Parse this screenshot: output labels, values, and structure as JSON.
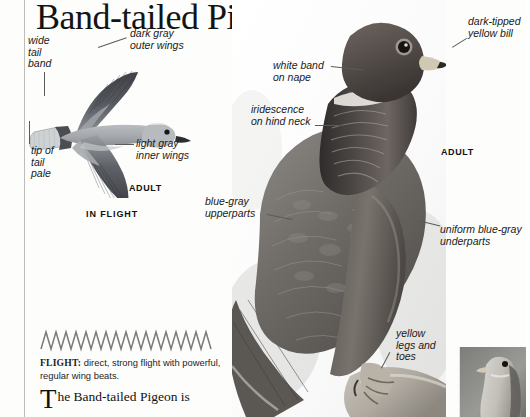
{
  "page": {
    "title": "Band-tailed Pigeon",
    "background_color": "#fdfdfc",
    "rule_color": "#bdbdbd"
  },
  "flight_illustration": {
    "plate_label": "IN FLIGHT",
    "age_label": "ADULT",
    "callouts": [
      {
        "id": "wide-tail-band",
        "text": "wide\ntail\nband"
      },
      {
        "id": "dark-gray-outer-wings",
        "text": "dark gray\nouter wings"
      },
      {
        "id": "tip-of-tail-pale",
        "text": "tip of\ntail\npale"
      },
      {
        "id": "light-gray-inner-wings",
        "text": "light gray\ninner wings"
      }
    ]
  },
  "main_photo": {
    "age_label": "ADULT",
    "callouts": [
      {
        "id": "dark-tipped-yellow-bill",
        "text": "dark-tipped\nyellow bill"
      },
      {
        "id": "white-band-on-nape",
        "text": "white band\non nape"
      },
      {
        "id": "iridescence-on-hind-neck",
        "text": "iridescence\non hind neck"
      },
      {
        "id": "blue-gray-upperparts",
        "text": "blue-gray\nupperparts"
      },
      {
        "id": "uniform-blue-gray-underparts",
        "text": "uniform blue-gray\nunderparts"
      },
      {
        "id": "yellow-legs-and-toes",
        "text": "yellow\nlegs and\ntoes"
      }
    ]
  },
  "flight_pattern": {
    "heading": "FLIGHT:",
    "description": " direct, strong flight with powerful, regular wing beats."
  },
  "body_text": {
    "dropcap": "T",
    "rest": "he Band-tailed Pigeon is"
  },
  "colors": {
    "text": "#141414",
    "leader": "#5b5b5b",
    "rule": "#bdbdbd",
    "wing_dark": "#4b4d52",
    "wing_light": "#a9adb1",
    "body_light": "#c2c6c8"
  }
}
